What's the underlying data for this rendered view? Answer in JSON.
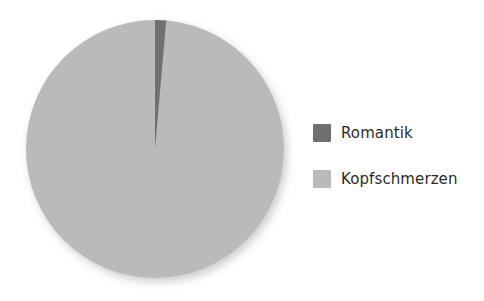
{
  "chart_data": {
    "type": "pie",
    "title": "",
    "subtitle": "",
    "xlabel": "",
    "ylabel": "",
    "categories": [
      "Romantik",
      "Kopfschmerzen"
    ],
    "values": [
      1.4,
      98.6
    ],
    "value_unit": "percent",
    "start_angle_deg": 0,
    "direction": "clockwise",
    "grid": false,
    "legend_position": "right",
    "annotations": [],
    "slices": [
      {
        "label": "Romantik",
        "value": 1.4,
        "percent": "1.4%",
        "angle_deg": 5,
        "color": "#6e7172"
      },
      {
        "label": "Kopfschmerzen",
        "value": 98.6,
        "percent": "98.6%",
        "angle_deg": 355,
        "color": "#b9bbba"
      }
    ]
  },
  "legend": {
    "items": [
      {
        "label": "Romantik",
        "color": "#6e7172",
        "swatch_name": "legend-swatch-romantik"
      },
      {
        "label": "Kopfschmerzen",
        "color": "#b9bbba",
        "swatch_name": "legend-swatch-kopfschmerzen"
      }
    ]
  },
  "colors": {
    "background": "#ffffff",
    "slice_dark": "#6e7172",
    "slice_light": "#b9bbba",
    "text": "#2b2b2b",
    "shadow": "rgba(120,120,120,0.30)"
  },
  "geometry": {
    "center_x": 155,
    "center_y": 149,
    "radius": 129
  }
}
